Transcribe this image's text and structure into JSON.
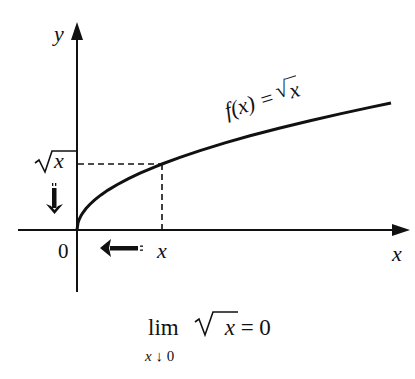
{
  "diagram": {
    "axes": {
      "y_label": "y",
      "x_label": "x",
      "origin_label": "0"
    },
    "curve": {
      "label_prefix": "f(x) = ",
      "label_radicand": "x",
      "function": "sqrt(x)"
    },
    "marker": {
      "x_label": "x",
      "y_label_radicand": "x"
    },
    "limit": {
      "operator": "lim",
      "subscript_var": "x",
      "subscript_arrow": "↓",
      "subscript_target": "0",
      "expression_radicand": "x",
      "equals": "= 0"
    },
    "colors": {
      "ink": "#111111",
      "background": "#ffffff"
    }
  }
}
